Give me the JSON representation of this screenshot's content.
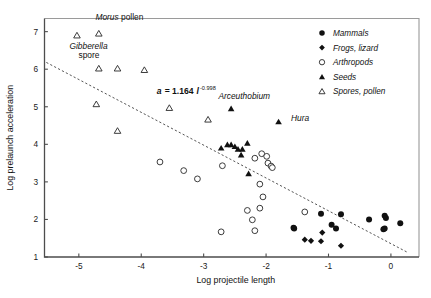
{
  "chart_data": {
    "type": "scatter",
    "title": "",
    "xlabel": "Log projectile length",
    "ylabel": "Log prelaunch acceleration",
    "xlim": [
      -5.55,
      0.45
    ],
    "ylim": [
      1.0,
      7.35
    ],
    "xticks": [
      -5,
      -4,
      -3,
      -2,
      -1,
      0
    ],
    "xticklabels": [
      "-5",
      "-4",
      "-3",
      "-2",
      "-1",
      "0"
    ],
    "yticks": [
      1,
      2,
      3,
      4,
      5,
      6,
      7
    ],
    "yticklabels": [
      "1",
      "2",
      "3",
      "4",
      "5",
      "6",
      "7"
    ],
    "grid": false,
    "legend_position": "top-right",
    "legend": [
      {
        "label": "Mammals",
        "marker": "filled-circle"
      },
      {
        "label": "Frogs, lizard",
        "marker": "filled-diamond"
      },
      {
        "label": "Arthropods",
        "marker": "open-circle"
      },
      {
        "label": "Seeds",
        "marker": "filled-triangle"
      },
      {
        "label": "Spores, pollen",
        "marker": "open-triangle"
      }
    ],
    "annotations": [
      {
        "text": "Morus",
        "text2": " pollen",
        "style": "italic-plus-roman",
        "x": -4.35,
        "y": 7.3
      },
      {
        "text": "Gibberella",
        "text2": "spore",
        "style": "italic-over-roman",
        "x": -5.15,
        "y": 6.55
      },
      {
        "text": "Arceuthobium",
        "style": "italic",
        "x": -2.35,
        "y": 5.2
      },
      {
        "text": "Hura",
        "style": "italic",
        "x": -1.6,
        "y": 4.62
      }
    ],
    "fit_equation": {
      "var": "a",
      "equals": "= 1.164",
      "length_symbol": "l",
      "exponent": "-0.998",
      "x": -3.75,
      "y": 5.35
    },
    "trendline": {
      "x_start": -5.52,
      "y_start": 6.18,
      "x_end": 0.27,
      "y_end": 1.12,
      "style": "dotted"
    },
    "series": [
      {
        "name": "Spores, pollen",
        "marker": "open-triangle",
        "points": [
          [
            -5.03,
            6.9
          ],
          [
            -4.68,
            6.95
          ],
          [
            -4.68,
            6.02
          ],
          [
            -4.38,
            6.02
          ],
          [
            -3.95,
            5.98
          ],
          [
            -4.72,
            5.07
          ],
          [
            -3.55,
            4.97
          ],
          [
            -4.38,
            4.36
          ],
          [
            -2.93,
            4.66
          ]
        ]
      },
      {
        "name": "Seeds",
        "marker": "filled-triangle",
        "points": [
          [
            -2.56,
            4.95
          ],
          [
            -1.8,
            4.6
          ],
          [
            -2.72,
            3.9
          ],
          [
            -2.62,
            3.99
          ],
          [
            -2.56,
            3.99
          ],
          [
            -2.5,
            3.94
          ],
          [
            -2.45,
            3.87
          ],
          [
            -2.38,
            3.87
          ],
          [
            -2.3,
            4.03
          ],
          [
            -2.4,
            3.72
          ],
          [
            -2.28,
            3.22
          ]
        ]
      },
      {
        "name": "Arthropods",
        "marker": "open-circle",
        "points": [
          [
            -3.7,
            3.53
          ],
          [
            -3.32,
            3.3
          ],
          [
            -3.1,
            3.08
          ],
          [
            -2.7,
            3.43
          ],
          [
            -2.18,
            3.63
          ],
          [
            -2.07,
            3.75
          ],
          [
            -1.99,
            3.68
          ],
          [
            -1.97,
            3.5
          ],
          [
            -1.92,
            3.42
          ],
          [
            -1.9,
            3.38
          ],
          [
            -2.1,
            2.94
          ],
          [
            -2.05,
            2.6
          ],
          [
            -2.3,
            2.24
          ],
          [
            -2.22,
            1.99
          ],
          [
            -2.1,
            2.3
          ],
          [
            -2.72,
            1.67
          ],
          [
            -2.18,
            1.7
          ],
          [
            -1.38,
            2.2
          ]
        ]
      },
      {
        "name": "Mammals",
        "marker": "filled-circle",
        "points": [
          [
            -1.12,
            2.15
          ],
          [
            -0.8,
            2.14
          ],
          [
            -0.35,
            2.0
          ],
          [
            -0.1,
            2.1
          ],
          [
            -0.08,
            2.04
          ],
          [
            -0.12,
            1.74
          ],
          [
            -0.1,
            1.76
          ],
          [
            0.15,
            1.9
          ],
          [
            -0.95,
            1.86
          ],
          [
            -0.88,
            1.76
          ],
          [
            -1.56,
            1.78
          ],
          [
            -1.55,
            1.76
          ]
        ]
      },
      {
        "name": "Frogs, lizard",
        "marker": "filled-diamond",
        "points": [
          [
            -1.38,
            1.46
          ],
          [
            -1.28,
            1.43
          ],
          [
            -1.12,
            1.42
          ],
          [
            -1.1,
            1.65
          ],
          [
            -0.8,
            1.3
          ]
        ]
      }
    ]
  }
}
